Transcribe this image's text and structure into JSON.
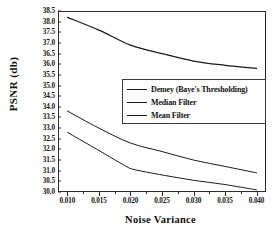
{
  "chart_data": {
    "type": "line",
    "title": "",
    "xlabel": "Noise Variance",
    "ylabel": "PSNR (db)",
    "xlim": [
      0.0085,
      0.0415
    ],
    "ylim": [
      30.0,
      38.5
    ],
    "grid": false,
    "legend_position": "center-right",
    "x": [
      0.01,
      0.015,
      0.02,
      0.025,
      0.03,
      0.035,
      0.04
    ],
    "xticks": [
      "0.010",
      "0.015",
      "0.020",
      "0.025",
      "0.030",
      "0.035",
      "0.040"
    ],
    "yticks": [
      "30.0",
      "30.5",
      "31.0",
      "31.5",
      "32.0",
      "32.5",
      "33.0",
      "33.5",
      "34.0",
      "34.5",
      "35.0",
      "35.5",
      "36.0",
      "36.5",
      "37.0",
      "37.5",
      "38.0",
      "38.5"
    ],
    "series": [
      {
        "name": "Demey (Baye's Thresholding)",
        "color": "#1a1a1a",
        "values": [
          38.2,
          37.6,
          36.9,
          36.5,
          36.15,
          35.95,
          35.8
        ]
      },
      {
        "name": "Median Filter",
        "color": "#1a1a1a",
        "values": [
          33.8,
          33.0,
          32.3,
          31.9,
          31.5,
          31.2,
          30.9
        ]
      },
      {
        "name": "Mean Filter",
        "color": "#1a1a1a",
        "values": [
          32.8,
          31.95,
          31.1,
          30.8,
          30.55,
          30.35,
          30.1
        ]
      }
    ]
  },
  "legend": {
    "entries": [
      {
        "label": "Demey (Baye's Thresholding)"
      },
      {
        "label": "Median Filter"
      },
      {
        "label": "Mean Filter"
      }
    ]
  },
  "axes": {
    "x_title": "Noise Variance",
    "y_title": "PSNR (db)"
  }
}
